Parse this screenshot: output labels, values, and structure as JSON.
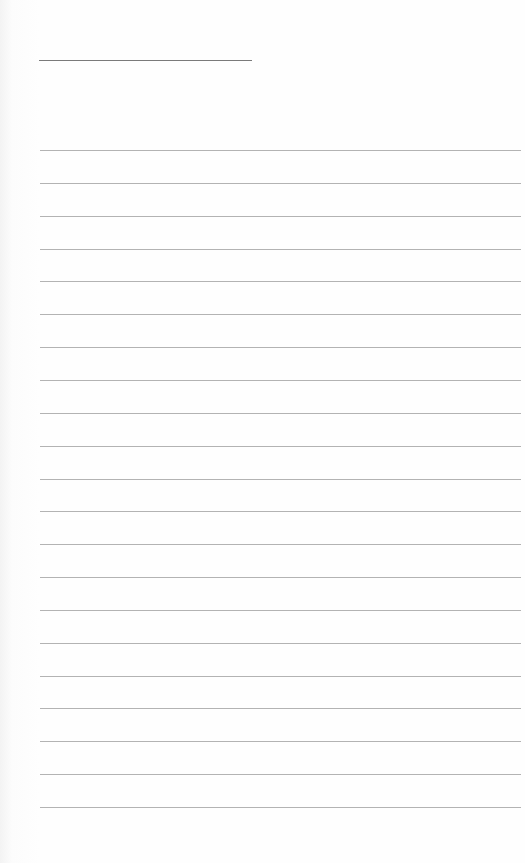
{
  "paper": {
    "background": "#fdfdfd",
    "line_color": "#9a9a9a",
    "title_line": {
      "x": 39,
      "y": 60,
      "width": 213
    },
    "ruled_lines": {
      "count": 21,
      "start_y": 150,
      "spacing": 32.85,
      "x_start": 40,
      "x_end": 521
    }
  }
}
